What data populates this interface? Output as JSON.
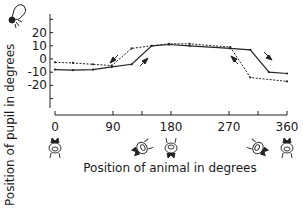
{
  "chart_data": {
    "type": "line",
    "title": "",
    "xlabel": "Position of animal in degrees",
    "ylabel": "Position of pupil in degrees",
    "xlim": [
      0,
      360
    ],
    "ylim": [
      -30,
      30
    ],
    "x_ticks": [
      0,
      90,
      135,
      180,
      270,
      315,
      360
    ],
    "x_tick_labels": [
      "0",
      "90",
      "",
      "180",
      "270",
      "",
      "360"
    ],
    "y_ticks": [
      30,
      20,
      10,
      0,
      -10,
      -20,
      -30
    ],
    "y_tick_labels": [
      "",
      "20",
      "10",
      "0",
      "-10",
      "-20",
      ""
    ],
    "grid": false,
    "legend": null,
    "series": [
      {
        "name": "solid (increasing rotation)",
        "style": "solid",
        "x": [
          0,
          28,
          59,
          88,
          119,
          150,
          177,
          209,
          272,
          303,
          332,
          360
        ],
        "values": [
          -8,
          -8.5,
          -8,
          -6,
          -4,
          10,
          11,
          10,
          8,
          7,
          -10,
          -11
        ]
      },
      {
        "name": "dotted (decreasing rotation)",
        "style": "dotted",
        "x": [
          0,
          28,
          59,
          88,
          119,
          150,
          177,
          209,
          272,
          303,
          360
        ],
        "values": [
          -2.5,
          -3,
          -4,
          -5,
          8,
          10,
          11.5,
          11.5,
          9,
          -14,
          -17
        ]
      }
    ],
    "annotations": [
      "direction arrows near hysteresis loops at ~110-140 deg and ~270-320 deg",
      "animal orientation drawings under x-axis at 0, 135, 180, 315, 360 deg",
      "eye/pupil drawing at top-left of y-axis"
    ]
  }
}
